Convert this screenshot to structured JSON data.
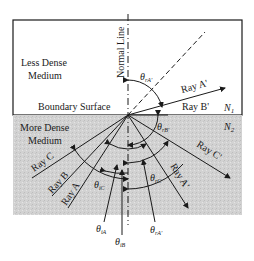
{
  "diagram": {
    "normal_line_label": "Normal Line",
    "upper_medium": {
      "line1": "Less Dense",
      "line2": "Medium"
    },
    "lower_medium": {
      "line1": "More Dense",
      "line2": "Medium"
    },
    "boundary_label": "Boundary Surface",
    "n1": "N",
    "n1_sub": "1",
    "n2": "N",
    "n2_sub": "2",
    "rays": {
      "ray_a": "Ray A",
      "ray_b": "Ray B",
      "ray_c": "Ray C",
      "ray_a_prime": "Ray A'",
      "ray_b_prime": "Ray B'",
      "ray_c_prime": "Ray C'",
      "ray_a_refl": "Ray A'"
    },
    "angles": {
      "theta": "θ",
      "r_a_prime_sub": "rA'",
      "r_b_prime_sub": "rB'",
      "i_c_sub": "iC",
      "r_c_sub": "rC",
      "i_a_sub": "iA",
      "i_b_sub": "iB",
      "r_a_refl_sub": "rA'"
    },
    "colors": {
      "upper_fill": "#ffffff",
      "lower_fill": "#d4d4d4",
      "stroke": "#1a1a1a"
    }
  }
}
